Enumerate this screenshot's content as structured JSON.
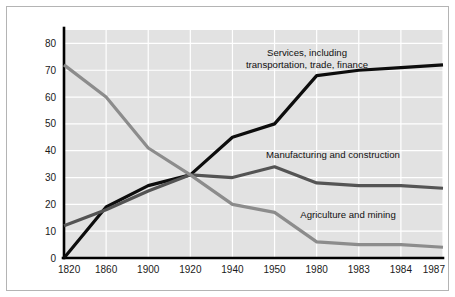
{
  "figure": {
    "background_color": "#ffffff",
    "frame_color": "#b4b4b4"
  },
  "chart_data": {
    "type": "line",
    "title": "",
    "subtitle": "",
    "xlabel": "",
    "ylabel": "",
    "categories": [
      "1820",
      "1860",
      "1900",
      "1920",
      "1940",
      "1950",
      "1980",
      "1983",
      "1984",
      "1987"
    ],
    "x": [
      1820,
      1860,
      1900,
      1920,
      1940,
      1950,
      1980,
      1983,
      1984,
      1987
    ],
    "ylim": [
      0,
      85
    ],
    "yticks": [
      0,
      10,
      20,
      30,
      40,
      50,
      60,
      70,
      80
    ],
    "ytick_labels": [
      "0",
      "10",
      "20",
      "30",
      "40",
      "50",
      "60",
      "70",
      "80"
    ],
    "grid": true,
    "grid_color": "#ffffff",
    "plot_background": "#e2e2e2",
    "legend": "inline-annotations",
    "series": [
      {
        "name": "Services, including transportation, trade, finance",
        "label_lines": [
          "Services, including",
          "transportation, trade, finance"
        ],
        "color": "#0d0d0d",
        "width": 3.2,
        "values": [
          0,
          19,
          27,
          31,
          45,
          50,
          68,
          70,
          71,
          72
        ]
      },
      {
        "name": "Manufacturing and construction",
        "label_lines": [
          "Manufacturing and construction"
        ],
        "color": "#545454",
        "width": 3.2,
        "values": [
          12,
          18,
          25,
          31,
          30,
          34,
          28,
          27,
          27,
          26
        ]
      },
      {
        "name": "Agriculture and mining",
        "label_lines": [
          "Agriculture and mining"
        ],
        "color": "#8c8c8c",
        "width": 3.2,
        "values": [
          72,
          60,
          41,
          31,
          20,
          17,
          6,
          5,
          5,
          4
        ]
      }
    ],
    "annotations": [
      {
        "name": "services-annotation",
        "lines": [
          "Services, including",
          "transportation, trade, finance"
        ],
        "x_px": 307,
        "y_px": 56,
        "anchor": "middle"
      },
      {
        "name": "manufacturing-annotation",
        "lines": [
          "Manufacturing and construction"
        ],
        "x_px": 333,
        "y_px": 158,
        "anchor": "middle"
      },
      {
        "name": "agriculture-annotation",
        "lines": [
          "Agriculture and mining"
        ],
        "x_px": 348,
        "y_px": 218,
        "anchor": "middle"
      }
    ]
  }
}
